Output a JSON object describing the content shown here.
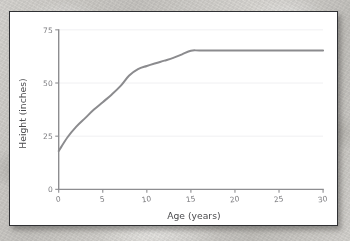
{
  "figure": {
    "background_color": "#ffffff",
    "frame_color": "#2f3033",
    "surface_color": "#cfcdc9"
  },
  "chart_data": {
    "type": "line",
    "title": "",
    "xlabel": "Age (years)",
    "ylabel": "Height (inches)",
    "xlim": [
      0,
      30
    ],
    "ylim": [
      0,
      75
    ],
    "xticks": [
      0,
      5,
      10,
      15,
      20,
      25,
      30
    ],
    "xtick_labels": [
      "0",
      "5",
      "10",
      "15",
      "20",
      "25",
      "30"
    ],
    "yticks": [
      0,
      25,
      50,
      75
    ],
    "ytick_labels": [
      "0",
      "25",
      "50",
      "75"
    ],
    "grid": true,
    "grid_axis": "y",
    "grid_color": "#f0f0f2",
    "legend": false,
    "series": [
      {
        "name": "Height",
        "color": "#8b8b8e",
        "line_width": 2.0,
        "x": [
          0,
          1,
          2,
          3,
          4,
          5,
          6,
          7,
          8,
          9,
          10,
          11,
          12,
          13,
          14,
          15,
          16,
          18,
          20,
          22,
          25,
          28,
          30
        ],
        "y": [
          18.0,
          24.5,
          29.5,
          33.5,
          37.5,
          41.0,
          44.5,
          48.5,
          53.5,
          56.5,
          58.0,
          59.3,
          60.5,
          61.8,
          63.5,
          65.2,
          65.3,
          65.3,
          65.3,
          65.3,
          65.3,
          65.3,
          65.3
        ]
      }
    ]
  }
}
